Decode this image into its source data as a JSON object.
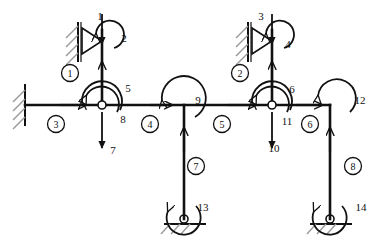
{
  "diagram": {
    "type": "structural-frame",
    "stroke_color": "#111111",
    "hatch_color": "#9a9a9a",
    "dof_labels": [
      {
        "id": "dof-1",
        "text": "1",
        "x": 100,
        "y": 16,
        "kind": "force-vertical"
      },
      {
        "id": "dof-2",
        "text": "2",
        "x": 124,
        "y": 38,
        "kind": "moment"
      },
      {
        "id": "dof-3",
        "text": "3",
        "x": 261,
        "y": 16,
        "kind": "force-vertical"
      },
      {
        "id": "dof-4",
        "text": "4",
        "x": 285,
        "y": 44,
        "kind": "moment"
      },
      {
        "id": "dof-5",
        "text": "5",
        "x": 128,
        "y": 88,
        "kind": "moment"
      },
      {
        "id": "dof-6",
        "text": "6",
        "x": 290,
        "y": 89,
        "kind": "moment"
      },
      {
        "id": "dof-7",
        "text": "7",
        "x": 113,
        "y": 150,
        "kind": "force-vertical"
      },
      {
        "id": "dof-8",
        "text": "8",
        "x": 122,
        "y": 119,
        "kind": "moment"
      },
      {
        "id": "dof-9",
        "text": "9",
        "x": 196,
        "y": 100,
        "kind": "moment"
      },
      {
        "id": "dof-10",
        "text": "10",
        "x": 271,
        "y": 148,
        "kind": "force-vertical"
      },
      {
        "id": "dof-11",
        "text": "11",
        "x": 285,
        "y": 121,
        "kind": "moment"
      },
      {
        "id": "dof-12",
        "text": "12",
        "x": 358,
        "y": 100,
        "kind": "moment"
      },
      {
        "id": "dof-13",
        "text": "13",
        "x": 201,
        "y": 208,
        "kind": "moment"
      },
      {
        "id": "dof-14",
        "text": "14",
        "x": 359,
        "y": 208,
        "kind": "moment"
      }
    ],
    "element_labels": [
      {
        "id": "element-1",
        "text": "1",
        "x": 70,
        "y": 73
      },
      {
        "id": "element-2",
        "text": "2",
        "x": 240,
        "y": 73
      },
      {
        "id": "element-3",
        "text": "3",
        "x": 56,
        "y": 124
      },
      {
        "id": "element-4",
        "text": "4",
        "x": 150,
        "y": 124
      },
      {
        "id": "element-5",
        "text": "5",
        "x": 222,
        "y": 124
      },
      {
        "id": "element-6",
        "text": "6",
        "x": 310,
        "y": 124
      },
      {
        "id": "element-7",
        "text": "7",
        "x": 196,
        "y": 166
      },
      {
        "id": "element-8",
        "text": "8",
        "x": 353,
        "y": 166
      }
    ],
    "members": [
      {
        "id": "beam-main",
        "x1": 25,
        "y1": 105,
        "x2": 330,
        "y2": 105
      },
      {
        "id": "column-1",
        "x1": 102,
        "y1": 30,
        "x2": 102,
        "y2": 105
      },
      {
        "id": "column-2",
        "x1": 272,
        "y1": 30,
        "x2": 272,
        "y2": 105
      },
      {
        "id": "column-7",
        "x1": 184,
        "y1": 105,
        "x2": 184,
        "y2": 218
      },
      {
        "id": "column-8",
        "x1": 330,
        "y1": 105,
        "x2": 330,
        "y2": 218
      }
    ],
    "supports": [
      {
        "id": "support-wall-left",
        "kind": "fixed-wall",
        "x": 25,
        "y": 105
      },
      {
        "id": "support-pin-top-1",
        "kind": "pin-wall",
        "x": 102,
        "y": 38
      },
      {
        "id": "support-pin-top-2",
        "kind": "pin-wall",
        "x": 272,
        "y": 38
      },
      {
        "id": "support-pin-bot-7",
        "kind": "pin-ground",
        "x": 184,
        "y": 218
      },
      {
        "id": "support-pin-bot-8",
        "kind": "pin-ground",
        "x": 330,
        "y": 218
      }
    ],
    "joints": [
      {
        "id": "joint-left",
        "x": 102,
        "y": 105
      },
      {
        "id": "joint-mid",
        "x": 184,
        "y": 105
      },
      {
        "id": "joint-right",
        "x": 272,
        "y": 105
      },
      {
        "id": "joint-corner",
        "x": 330,
        "y": 105
      }
    ]
  }
}
